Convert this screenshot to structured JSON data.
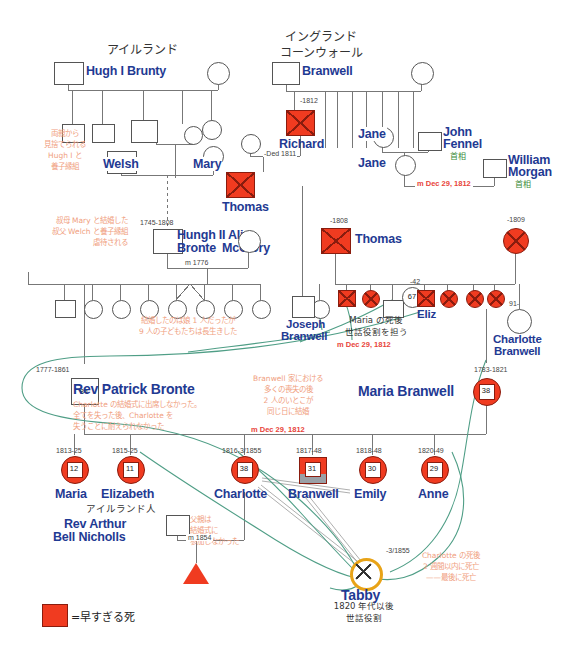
{
  "meta": {
    "colors": {
      "name_blue": "#1f3a93",
      "death_red": "#f03b20",
      "note_orange": "#f0a080",
      "marriage_red": "#e8443a",
      "pm_green": "#3a8b3a",
      "curve_teal": "#4f9e86",
      "line_gray": "#777777",
      "tabby_gold": "#e8a317"
    }
  },
  "headings": {
    "ireland": "アイルランド",
    "england": "イングランド",
    "cornwall": "コーンウォール"
  },
  "people": [
    {
      "id": "hugh1",
      "name": "Hugh I Brunty",
      "shape": "square",
      "dead": false
    },
    {
      "id": "hugh1_wife",
      "name": "",
      "shape": "circle",
      "dead": false
    },
    {
      "id": "welsh",
      "name": "Welsh",
      "shape": "square",
      "dead": false
    },
    {
      "id": "mary",
      "name": "Mary",
      "shape": "circle",
      "dead": false
    },
    {
      "id": "hugh2",
      "name": "Hungh II Bronte",
      "shape": "square",
      "dead": false,
      "dates": "1745-1808"
    },
    {
      "id": "alice",
      "name": "Alice McClory",
      "shape": "circle",
      "dead": false
    },
    {
      "id": "branwell_t",
      "name": "Branwell",
      "shape": "square",
      "dead": false
    },
    {
      "id": "richard",
      "name": "Richard",
      "shape": "square",
      "dead": true,
      "dates": "-1812"
    },
    {
      "id": "thomas1",
      "name": "Thomas",
      "shape": "square",
      "dead": true,
      "dates": "-Ded 1811"
    },
    {
      "id": "jane1",
      "name": "Jane",
      "shape": "circle",
      "dead": false
    },
    {
      "id": "john_fennel",
      "name": "John Fennel",
      "shape": "square",
      "dead": false,
      "role": "首相"
    },
    {
      "id": "jane2",
      "name": "Jane",
      "shape": "circle",
      "dead": false
    },
    {
      "id": "william_morgan",
      "name": "William Morgan",
      "shape": "square",
      "dead": false,
      "role": "首相"
    },
    {
      "id": "thomas2",
      "name": "Thomas",
      "shape": "square",
      "dead": true,
      "dates": "-1808"
    },
    {
      "id": "thomas2_wife",
      "name": "",
      "shape": "circle",
      "dead": true,
      "dates": "-1809"
    },
    {
      "id": "eliz",
      "name": "Eliz",
      "shape": "circle",
      "dead": true,
      "dates": "-42",
      "age": "67"
    },
    {
      "id": "charlotte_b",
      "name": "Charlotte Branwell",
      "shape": "circle",
      "dead": false,
      "dates": "91-"
    },
    {
      "id": "joseph_b",
      "name": "Joseph Branwell",
      "shape": "square",
      "dead": false
    },
    {
      "id": "patrick",
      "name": "Rev Patrick Bronte",
      "shape": "square",
      "dead": false,
      "dates": "1777-1861",
      "age": "84"
    },
    {
      "id": "maria_b",
      "name": "Maria Branwell",
      "shape": "circle",
      "dead": true,
      "dates": "1783-1821",
      "age": "38"
    },
    {
      "id": "maria",
      "name": "Maria",
      "shape": "circle",
      "dead": true,
      "dates": "1813-25",
      "age": "12"
    },
    {
      "id": "elizabeth",
      "name": "Elizabeth",
      "shape": "circle",
      "dead": true,
      "dates": "1815-25",
      "age": "11"
    },
    {
      "id": "charlotte",
      "name": "Charlotte",
      "shape": "circle",
      "dead": true,
      "dates": "1816-3/1855",
      "age": "38"
    },
    {
      "id": "branwell",
      "name": "Branwell",
      "shape": "square",
      "dead": true,
      "dates": "1817-48",
      "age": "31"
    },
    {
      "id": "emily",
      "name": "Emily",
      "shape": "circle",
      "dead": true,
      "dates": "1818-48",
      "age": "30"
    },
    {
      "id": "anne",
      "name": "Anne",
      "shape": "circle",
      "dead": true,
      "dates": "1820-49",
      "age": "29"
    },
    {
      "id": "nicholls",
      "name": "Rev Arthur Bell Nicholls",
      "shape": "square",
      "dead": false,
      "origin": "アイルランド人"
    },
    {
      "id": "tabby",
      "name": "Tabby",
      "shape": "circle",
      "dead": true,
      "dates": "-3/1855"
    }
  ],
  "labels": {
    "hugh1": "Hugh I Brunty",
    "welsh": "Welsh",
    "mary": "Mary",
    "hugh2_line1": "Hungh II",
    "hugh2_line2": "Bronte",
    "alice_line1": "Alice",
    "alice_line2": "McClory",
    "hugh2_dates": "1745-1808",
    "m1776": "m 1776",
    "branwell_top": "Branwell",
    "richard": "Richard",
    "richard_dates": "-1812",
    "thomas1": "Thomas",
    "thomas1_dates": "-Ded 1811",
    "jane1": "Jane",
    "jane2": "Jane",
    "john_fennel_l1": "John",
    "john_fennel_l2": "Fennel",
    "john_fennel_role": "首相",
    "william_morgan_l1": "William",
    "william_morgan_l2": "Morgan",
    "william_morgan_role": "首相",
    "m_dec_1812_a": "m Dec 29, 1812",
    "m_dec_1812_b": "m Dec 29, 1812",
    "m_dec_1812_c": "m Dec 29, 1812",
    "thomas2": "Thomas",
    "thomas2_dates": "-1808",
    "thomas2_wife_dates": "-1809",
    "eliz": "Eliz",
    "eliz_dates": "-42",
    "eliz_age": "67",
    "charlotte_b_l1": "Charlotte",
    "charlotte_b_l2": "Branwell",
    "charlotte_b_dates": "91-",
    "joseph_b_l1": "Joseph",
    "joseph_b_l2": "Branwell",
    "patrick": "Rev Patrick Bronte",
    "patrick_dates": "1777-1861",
    "patrick_age": "84",
    "maria_b": "Maria Branwell",
    "maria_b_dates": "1783-1821",
    "maria_b_age": "38",
    "maria": "Maria",
    "maria_dates": "1813-25",
    "maria_age": "12",
    "elizabeth": "Elizabeth",
    "elizabeth_dates": "1815-25",
    "elizabeth_age": "11",
    "charlotte": "Charlotte",
    "charlotte_dates": "1816-3/1855",
    "charlotte_age": "38",
    "branwell": "Branwell",
    "branwell_dates": "1817-48",
    "branwell_age": "31",
    "emily": "Emily",
    "emily_dates": "1818-48",
    "emily_age": "30",
    "anne": "Anne",
    "anne_dates": "1820-49",
    "anne_age": "29",
    "nicholls_l1": "Rev Arthur",
    "nicholls_l2": "Bell Nicholls",
    "nicholls_origin": "アイルランド人",
    "m1854": "m 1854",
    "tabby": "Tabby",
    "tabby_dates": "-3/1855"
  },
  "annotations": {
    "abandoned": "両親から\n見捨てられる\nHugh I と\n養子縁組",
    "abuse": "叔母 Mary と結婚した\n叔父 Welch と養子縁組\n虐待される",
    "siblings": "結婚したのは娘 1 人だったが\n9 人の子どもたちは長生きした",
    "maria_care": "Maria の死後\n世話役割を担う",
    "patrick_note": "Charlotte の結婚式に出席しなかった。\n全てを失った後、Charlotte を\n失うことに耐えられなかった",
    "cousins": "Branwell 家における\n多くの喪失の後\n2 人のいとこが\n同じ日に結婚",
    "father_absent": "父親は\n結婚式に\n参加しなかった",
    "tabby_role": "1820 年代以後\n世話役割",
    "charlotte_death": "Charlotte の死後\n2 週間以内に死亡\n——最後に死亡"
  },
  "legend": {
    "premature_death": "=早すぎる死"
  }
}
